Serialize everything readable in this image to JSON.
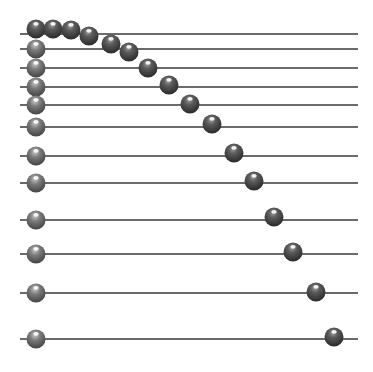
{
  "diagram": {
    "type": "abacus-rods",
    "background": "#ffffff",
    "rod_color": "#3a3a3a",
    "bead_color_dark": "#3c3c3c",
    "bead_color_mid": "#6a6a6a",
    "bead_highlight": "#ffffff",
    "rod_x_start": 20,
    "rod_x_end": 358,
    "bead_radius": 9.5,
    "rods": [
      {
        "y": 34,
        "left_bead_x": 36,
        "right_bead_x": 89,
        "right_bead_y": 36
      },
      {
        "y": 49,
        "left_bead_x": 36,
        "right_bead_x": 129,
        "right_bead_y": 52
      },
      {
        "y": 68,
        "left_bead_x": 36,
        "right_bead_x": 148,
        "right_bead_y": 68
      },
      {
        "y": 87,
        "left_bead_x": 36,
        "right_bead_x": 169,
        "right_bead_y": 85
      },
      {
        "y": 105,
        "left_bead_x": 36,
        "right_bead_x": 190,
        "right_bead_y": 104
      },
      {
        "y": 127,
        "left_bead_x": 36,
        "right_bead_x": 212,
        "right_bead_y": 124
      },
      {
        "y": 156,
        "left_bead_x": 36,
        "right_bead_x": 234,
        "right_bead_y": 153
      },
      {
        "y": 183,
        "left_bead_x": 36,
        "right_bead_x": 254,
        "right_bead_y": 181
      },
      {
        "y": 220,
        "left_bead_x": 36,
        "right_bead_x": 274,
        "right_bead_y": 217
      },
      {
        "y": 254,
        "left_bead_x": 36,
        "right_bead_x": 293,
        "right_bead_y": 252
      },
      {
        "y": 293,
        "left_bead_x": 36,
        "right_bead_x": 316,
        "right_bead_y": 292
      },
      {
        "y": 339,
        "left_bead_x": 36,
        "right_bead_x": 334,
        "right_bead_y": 337
      }
    ],
    "top_cluster_beads": [
      {
        "x": 36,
        "y": 29
      },
      {
        "x": 53,
        "y": 29
      },
      {
        "x": 71,
        "y": 30
      },
      {
        "x": 89,
        "y": 36
      },
      {
        "x": 111,
        "y": 44
      }
    ]
  }
}
